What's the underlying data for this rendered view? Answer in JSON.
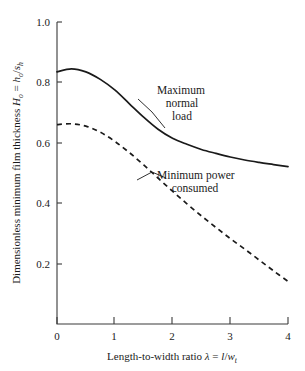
{
  "chart_data": {
    "type": "line",
    "title": "",
    "xlabel": "Length-to-width ratio λ = l/w_t",
    "ylabel": "Dimensionless minimum film thickness H_o = h_o/s_h",
    "xlim": [
      0,
      4
    ],
    "ylim": [
      0,
      1.0
    ],
    "grid": false,
    "legend_position": "inline-annotations",
    "xticks": [
      "0",
      "1",
      "2",
      "3",
      "4"
    ],
    "xtick_values": [
      0,
      1,
      2,
      3,
      4
    ],
    "yticks": [
      "0.2",
      "0.4",
      "0.6",
      "0.8",
      "1.0"
    ],
    "ytick_values": [
      0.2,
      0.4,
      0.6,
      0.8,
      1.0
    ],
    "x": [
      0,
      0.25,
      0.5,
      0.75,
      1.0,
      1.25,
      1.5,
      1.75,
      2.0,
      2.25,
      2.5,
      2.75,
      3.0,
      3.25,
      3.5,
      3.75,
      4.0
    ],
    "series": [
      {
        "name": "Maximum normal load",
        "style": "solid",
        "values": [
          0.835,
          0.845,
          0.835,
          0.81,
          0.775,
          0.73,
          0.685,
          0.645,
          0.615,
          0.595,
          0.578,
          0.565,
          0.553,
          0.543,
          0.535,
          0.528,
          0.521
        ]
      },
      {
        "name": "Minimum power consumed",
        "style": "dashed",
        "values": [
          0.66,
          0.663,
          0.655,
          0.635,
          0.605,
          0.568,
          0.527,
          0.483,
          0.44,
          0.398,
          0.358,
          0.32,
          0.283,
          0.248,
          0.212,
          0.176,
          0.141
        ]
      }
    ],
    "annotations": [
      {
        "id": "max-normal-load",
        "lines": [
          "Maximum",
          "normal",
          "load"
        ],
        "anchor_x": 1.32,
        "anchor_y": 0.717
      },
      {
        "id": "min-power-consumed",
        "lines": [
          "Minimum power",
          "consumed"
        ],
        "anchor_x": 1.57,
        "anchor_y": 0.512
      }
    ]
  },
  "axis_labels": {
    "y_prefix": "Dimensionless minimum film thickness ",
    "y_symbol_main": "H",
    "y_symbol_main_sub": "o",
    "y_equals": " = ",
    "y_num": "h",
    "y_num_sub": "o",
    "y_slash": "/",
    "y_den": "s",
    "y_den_sub": "h",
    "x_prefix": "Length-to-width ratio ",
    "x_lambda": "λ",
    "x_equals": " = ",
    "x_num": "l",
    "x_slash": "/",
    "x_den": "w",
    "x_den_sub": "t"
  },
  "annotation_text": {
    "max_load_line1": "Maximum",
    "max_load_line2": "normal",
    "max_load_line3": "load",
    "min_power_line1": "Minimum power",
    "min_power_line2": "consumed"
  },
  "ticks": {
    "x": [
      "0",
      "1",
      "2",
      "3",
      "4"
    ],
    "y": [
      "1.0",
      "0.8",
      "0.6",
      "0.4",
      "0.2"
    ]
  },
  "colors": {
    "background": "#ffffff",
    "ink": "#1a1a1a",
    "axis": "#3a3a3a"
  }
}
